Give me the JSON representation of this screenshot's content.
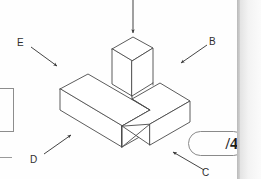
{
  "page": {
    "background_color": "#fefefe",
    "edge_band_color": "#b9b9b9",
    "watermark_text": "    "
  },
  "figure": {
    "type": "isometric-solid",
    "line_color": "#4a4a4a",
    "fill_color": "#ffffff"
  },
  "annotations": {
    "arrows": [
      {
        "id": "top-unlabelled",
        "label": "",
        "name": "arrow-top-down",
        "direction": "down"
      },
      {
        "id": "E",
        "label": "E",
        "name": "arrow-e",
        "direction": "down-right"
      },
      {
        "id": "B",
        "label": "B",
        "name": "arrow-b",
        "direction": "down-left"
      },
      {
        "id": "D",
        "label": "D",
        "name": "arrow-d",
        "direction": "up-right"
      },
      {
        "id": "C",
        "label": "C",
        "name": "arrow-c",
        "direction": "up-left"
      }
    ],
    "labels": {
      "e": "E",
      "b": "B",
      "d": "D",
      "c": "C"
    }
  },
  "marks": {
    "value": "/4",
    "aria_label": "marks out of 4"
  },
  "left_cropped_figure": {
    "present": true,
    "shape": "rectangle-outline"
  }
}
